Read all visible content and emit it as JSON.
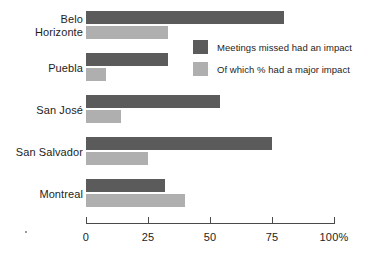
{
  "chart_data": {
    "type": "bar",
    "orientation": "horizontal",
    "title": "",
    "subtitle": "",
    "xlabel": "",
    "ylabel": "",
    "xlim": [
      0,
      100
    ],
    "grid": false,
    "legend_position": "inside-top-right",
    "categories": [
      "Belo\nHorizonte",
      "Puebla",
      "San José",
      "San Salvador",
      "Montreal"
    ],
    "tick_labels": [
      "0",
      "25",
      "50",
      "75",
      "100%"
    ],
    "tick_values": [
      0,
      25,
      50,
      75,
      100
    ],
    "series": [
      {
        "name": "Meetings missed had an impact",
        "color": "#5b5b5b",
        "values": [
          80,
          33,
          54,
          75,
          32
        ]
      },
      {
        "name": "Of which % had a major impact",
        "color": "#afafaf",
        "values": [
          33,
          8,
          14,
          25,
          40
        ]
      }
    ]
  },
  "legend": {
    "items": [
      {
        "label": "Meetings missed had an impact",
        "color": "#5b5b5b"
      },
      {
        "label": "Of which % had a major impact",
        "color": "#afafaf"
      }
    ]
  }
}
